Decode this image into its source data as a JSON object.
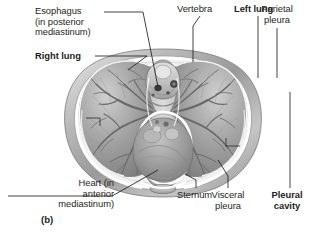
{
  "figure": {
    "id": "(b)",
    "type": "anatomical-illustration",
    "style": "grayscale medical illustration",
    "background_color": "#ffffff",
    "line_color": "#231f20"
  },
  "labels": [
    {
      "key": "esophagus",
      "text": "Esophagus\n(in posterior\nmediastinum)",
      "bold": false,
      "align": "left",
      "leader": "from right of first line angling down-right to the esophagus, a small dark oval anterior to the vertebral body in the posterior mediastinum"
    },
    {
      "key": "right_lung",
      "text": "Right lung",
      "bold": true,
      "align": "left",
      "leader": "horizontal line running right to the upper-left lung field"
    },
    {
      "key": "vertebra",
      "text": "Vertebra",
      "bold": false,
      "align": "left",
      "leader": "short line angling down-right to the vertebral body at top center"
    },
    {
      "key": "left_lung",
      "text": "Left lung",
      "bold": true,
      "align": "left",
      "leader": "vertical line dropping to the upper-right lung field"
    },
    {
      "key": "parietal_pleura",
      "text": "Parietal\npleura",
      "bold": false,
      "align": "center",
      "leader": "vertical line dropping to the outer pleural membrane on the right body wall"
    },
    {
      "key": "heart",
      "text": "Heart (in\nanterior\nmediastinum)",
      "bold": false,
      "align": "right",
      "leader": "line angling up-right to the heart within the pericardial sac at lower center"
    },
    {
      "key": "sternum",
      "text": "Sternum",
      "bold": false,
      "align": "left",
      "leader": "short vertical line rising to the small oval sternum at bottom center"
    },
    {
      "key": "visceral_pleura",
      "text": "Visceral\npleura",
      "bold": false,
      "align": "center",
      "leader": "vertical line rising to the membrane on the lung surface at lower right"
    },
    {
      "key": "pleural_cavity",
      "text": "Pleural\ncavity",
      "bold": true,
      "align": "center",
      "leader": "vertical line rising to the narrow space between parietal and visceral pleura on the right"
    }
  ],
  "structures": [
    "right lung with branching bronchial tree",
    "left lung with branching bronchial tree",
    "vertebral body and spinal canal",
    "esophagus",
    "descending aorta",
    "heart in pericardial sac",
    "sternum",
    "parietal pleura",
    "visceral pleura",
    "pleural cavity",
    "thoracic body wall"
  ]
}
